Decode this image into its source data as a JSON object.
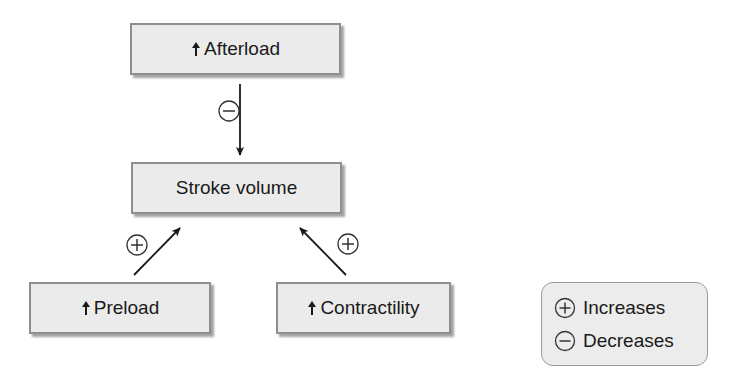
{
  "diagram": {
    "nodes": {
      "afterload": {
        "label": "Afterload",
        "prefix_icon": "up-arrow"
      },
      "stroke_volume": {
        "label": "Stroke volume"
      },
      "preload": {
        "label": "Preload",
        "prefix_icon": "up-arrow"
      },
      "contractility": {
        "label": "Contractility",
        "prefix_icon": "up-arrow"
      }
    },
    "edges": [
      {
        "from": "afterload",
        "to": "stroke_volume",
        "effect": "minus"
      },
      {
        "from": "preload",
        "to": "stroke_volume",
        "effect": "plus"
      },
      {
        "from": "contractility",
        "to": "stroke_volume",
        "effect": "plus"
      }
    ]
  },
  "legend": {
    "items": [
      {
        "symbol": "plus",
        "label": "Increases"
      },
      {
        "symbol": "minus",
        "label": "Decreases"
      }
    ]
  },
  "colors": {
    "box_fill": "#ebebeb",
    "box_border": "#8f8f8f",
    "arrow": "#1a1a1a",
    "background": "#ffffff"
  }
}
